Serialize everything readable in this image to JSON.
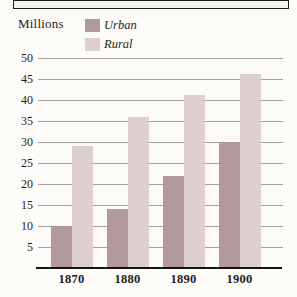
{
  "figure": {
    "y_axis_title": "Millions"
  },
  "colors": {
    "urban": "#b29a9c",
    "rural": "#decfcf",
    "gridline": "#a3a1a0",
    "baseline": "#141414",
    "text": "#1e1e1e",
    "background": "#fcfbf8"
  },
  "chart_data": {
    "type": "bar",
    "title": "",
    "ylabel": "Millions",
    "xlabel": "",
    "categories": [
      "1870",
      "1880",
      "1890",
      "1900"
    ],
    "series": [
      {
        "name": "Urban",
        "color": "#b29a9c",
        "values": [
          10,
          14,
          22,
          30
        ]
      },
      {
        "name": "Rural",
        "color": "#decfcf",
        "values": [
          29,
          36,
          41,
          46
        ]
      }
    ],
    "ylim": [
      0,
      50
    ],
    "yticks": [
      5,
      10,
      15,
      20,
      25,
      30,
      35,
      40,
      45,
      50
    ],
    "grid": true,
    "legend_position": "top-left",
    "legend_entries": [
      "Urban",
      "Rural"
    ]
  }
}
